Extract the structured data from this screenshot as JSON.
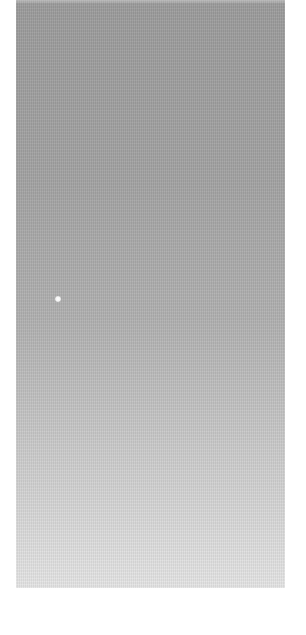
{
  "scene": {
    "description": "gray textured gradient surface",
    "colors": {
      "background": "#ffffff",
      "panel_top": "#9c9c9c",
      "panel_bottom": "#e6e6e6",
      "highlight_dot": "#ffffff"
    }
  }
}
